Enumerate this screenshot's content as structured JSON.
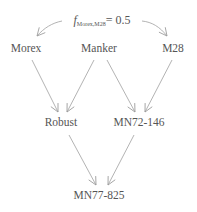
{
  "annotation": {
    "symbol": "f",
    "subscript": "Morex,M28",
    "equals": "= 0.5"
  },
  "nodes": {
    "morex": "Morex",
    "manker": "Manker",
    "m28": "M28",
    "robust": "Robust",
    "mn72": "MN72-146",
    "mn77": "MN77-825"
  },
  "edges": [
    {
      "from": "Morex",
      "to": "Robust"
    },
    {
      "from": "Manker",
      "to": "Robust"
    },
    {
      "from": "Manker",
      "to": "MN72-146"
    },
    {
      "from": "M28",
      "to": "MN72-146"
    },
    {
      "from": "Robust",
      "to": "MN77-825"
    },
    {
      "from": "MN72-146",
      "to": "MN77-825"
    }
  ],
  "colors": {
    "line": "#9a9a9a",
    "text": "#555555"
  }
}
